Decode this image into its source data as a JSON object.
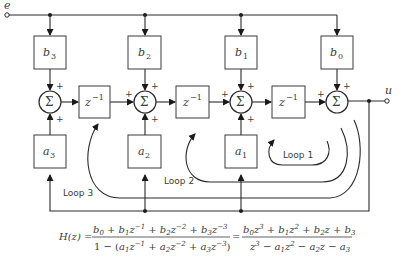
{
  "signals": {
    "input": "e",
    "output": "u"
  },
  "sum_symbol": "Σ",
  "plus": "+",
  "gains_b": [
    {
      "name": "b",
      "sub": "3"
    },
    {
      "name": "b",
      "sub": "2"
    },
    {
      "name": "b",
      "sub": "1"
    },
    {
      "name": "b",
      "sub": "0"
    }
  ],
  "gains_a": [
    {
      "name": "a",
      "sub": "3"
    },
    {
      "name": "a",
      "sub": "2"
    },
    {
      "name": "a",
      "sub": "1"
    }
  ],
  "delay": {
    "base": "z",
    "exp": "−1"
  },
  "loops": [
    "Loop 1",
    "Loop 2",
    "Loop 3"
  ],
  "equation": {
    "lhs": "H(z) =",
    "num1": "b0 + b1z^-1 + b2z^-2 + b3z^-3",
    "den1": "1 − (a1z^-1 + a2z^-2 + a3z^-3)",
    "eq2": "=",
    "num2": "b0z^3 + b1z^2 + b2z + b3",
    "den2": "z^3 − a1z^2 − a2z − a3"
  }
}
